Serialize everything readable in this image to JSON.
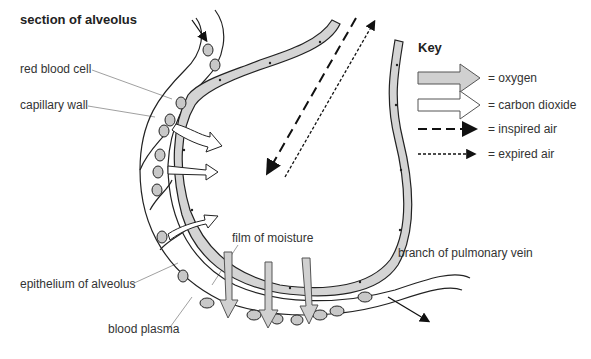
{
  "title": "section of alveolus",
  "labels": {
    "red_blood_cell": "red blood cell",
    "capillary_wall": "capillary wall",
    "epithelium": "epithelium of alveolus",
    "blood_plasma": "blood plasma",
    "film_of_moisture": "film of moisture",
    "pulmonary_vein": "branch of pulmonary vein"
  },
  "key": {
    "title": "Key",
    "items": [
      {
        "label": "= oxygen",
        "style": "filled-arrow",
        "color": "#d0d0d0"
      },
      {
        "label": "= carbon dioxide",
        "style": "hollow-arrow",
        "color": "#ffffff"
      },
      {
        "label": "= inspired air",
        "style": "dashed-arrow",
        "color": "#000000"
      },
      {
        "label": "= expired air",
        "style": "dotted-arrow",
        "color": "#000000"
      }
    ]
  },
  "colors": {
    "cell_fill": "#d4d4d4",
    "outline": "#222222",
    "leader_line": "#888888"
  }
}
